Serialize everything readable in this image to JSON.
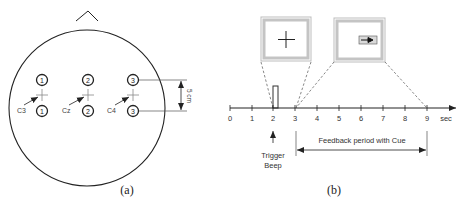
{
  "panel_a": {
    "caption": "(a)",
    "electrodes": [
      {
        "site": "C3",
        "channel_top": "1",
        "channel_bottom": "1"
      },
      {
        "site": "Cz",
        "channel_top": "2",
        "channel_bottom": "2"
      },
      {
        "site": "C4",
        "channel_top": "3",
        "channel_bottom": "3"
      }
    ],
    "distance_label": "5 cm"
  },
  "panel_b": {
    "caption": "(b)",
    "axis_ticks": [
      "0",
      "1",
      "2",
      "3",
      "4",
      "5",
      "6",
      "7",
      "8",
      "9"
    ],
    "axis_unit": "sec",
    "trigger_label_line1": "Trigger",
    "trigger_label_line2": "Beep",
    "feedback_label": "Feedback period with Cue",
    "screens": [
      {
        "name": "fixation-cross-screen",
        "symbol": "cross"
      },
      {
        "name": "cue-arrow-screen",
        "symbol": "right-arrow"
      }
    ]
  },
  "colors": {
    "stroke": "#222222",
    "screen_frame": "#bdbdbd",
    "text": "#333333"
  }
}
